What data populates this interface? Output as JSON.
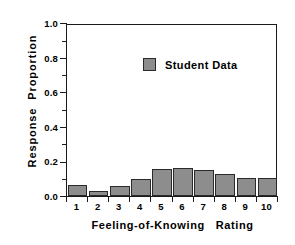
{
  "chart_data": {
    "type": "bar",
    "title": "",
    "xlabel": "Feeling-of-Knowing   Rating",
    "ylabel": "Response  Proportion",
    "categories": [
      "1",
      "2",
      "3",
      "4",
      "5",
      "6",
      "7",
      "8",
      "9",
      "10"
    ],
    "values": [
      0.062,
      0.028,
      0.058,
      0.1,
      0.155,
      0.16,
      0.148,
      0.128,
      0.105,
      0.105
    ],
    "series": [
      {
        "name": "Student Data",
        "values": [
          0.062,
          0.028,
          0.058,
          0.1,
          0.155,
          0.16,
          0.148,
          0.128,
          0.105,
          0.105
        ],
        "color": "#8d8d8d"
      }
    ],
    "ylim": [
      0.0,
      1.0
    ],
    "y_major_ticks": [
      0.0,
      0.2,
      0.4,
      0.6,
      0.8,
      1.0
    ],
    "y_tick_labels": [
      "0.0",
      "0.2",
      "0.4",
      "0.6",
      "0.8",
      "1.0"
    ],
    "y_minor_ticks": [
      0.1,
      0.3,
      0.5,
      0.7,
      0.9
    ],
    "grid": false,
    "legend_position": "top-left",
    "legend_entries": [
      "Student Data"
    ],
    "bar_color": "#8d8d8d",
    "bar_edge_color": "#2a2a2a",
    "axis_color": "#1a1a1a",
    "background_color": "#ffffff"
  },
  "legend": {
    "label": "Student Data"
  }
}
